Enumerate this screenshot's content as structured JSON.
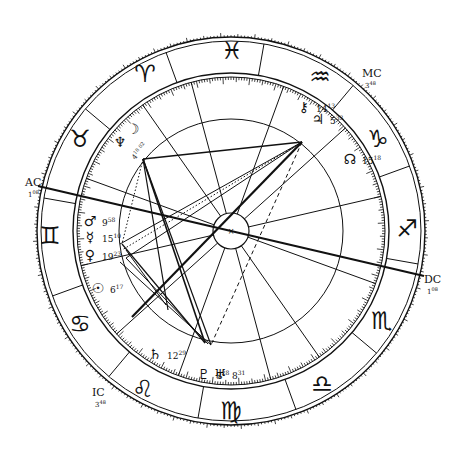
{
  "chart": {
    "center": [
      231,
      231
    ],
    "radii": {
      "outer": 194,
      "outer_inner": 190,
      "zodiac_inner": 158,
      "zodiac_inner2": 154,
      "house_circle": 112,
      "core": 18
    },
    "asc_angle_deg": 193,
    "colors": {
      "ink": "#111111",
      "background": "#ffffff"
    }
  },
  "zodiac_signs": [
    {
      "name": "aries",
      "glyph": "♈",
      "x": 145,
      "y": 75
    },
    {
      "name": "taurus",
      "glyph": "♉",
      "x": 80,
      "y": 140
    },
    {
      "name": "gemini",
      "glyph": "♊",
      "x": 50,
      "y": 237
    },
    {
      "name": "cancer",
      "glyph": "♋",
      "x": 80,
      "y": 325
    },
    {
      "name": "leo",
      "glyph": "♌",
      "x": 143,
      "y": 390
    },
    {
      "name": "virgo",
      "glyph": "♍",
      "x": 231,
      "y": 412
    },
    {
      "name": "libra",
      "glyph": "♎",
      "x": 322,
      "y": 385
    },
    {
      "name": "scorpio",
      "glyph": "♏",
      "x": 382,
      "y": 322
    },
    {
      "name": "sagittarius",
      "glyph": "♐",
      "x": 407,
      "y": 230
    },
    {
      "name": "capricorn",
      "glyph": "♑",
      "x": 378,
      "y": 140
    },
    {
      "name": "aquarius",
      "glyph": "♒",
      "x": 320,
      "y": 78
    },
    {
      "name": "pisces",
      "glyph": "♓",
      "x": 232,
      "y": 52
    }
  ],
  "angles": [
    {
      "name": "AC",
      "label": "AC",
      "degree": "1",
      "minutes": "08",
      "x": 25,
      "y": 186
    },
    {
      "name": "DC",
      "label": "DC",
      "degree": "1",
      "minutes": "08",
      "x": 424,
      "y": 283
    },
    {
      "name": "MC",
      "label": "MC",
      "degree": "3",
      "minutes": "48",
      "x": 362,
      "y": 77
    },
    {
      "name": "IC",
      "label": "IC",
      "degree": "3",
      "minutes": "48",
      "x": 92,
      "y": 396
    }
  ],
  "planets": [
    {
      "name": "moon",
      "glyph": "☽",
      "x": 133,
      "y": 130
    },
    {
      "name": "neptune",
      "glyph": "♆",
      "x": 120,
      "y": 143
    },
    {
      "name": "moon-neptune-degree",
      "text": "4",
      "sup": "18 02",
      "x": 135,
      "y": 160
    },
    {
      "name": "mars",
      "glyph": "♂",
      "x": 90,
      "y": 222,
      "degree": "9",
      "minutes": "58"
    },
    {
      "name": "mercury",
      "glyph": "☿",
      "x": 90,
      "y": 238,
      "degree": "15",
      "minutes": "10"
    },
    {
      "name": "venus",
      "glyph": "♀",
      "x": 90,
      "y": 256,
      "degree": "19",
      "minutes": "23"
    },
    {
      "name": "sun",
      "glyph": "☉",
      "x": 98,
      "y": 289,
      "degree": "6",
      "minutes": "17"
    },
    {
      "name": "saturn",
      "glyph": "♄",
      "x": 155,
      "y": 355,
      "degree": "12",
      "minutes": "29"
    },
    {
      "name": "pluto",
      "glyph": "♇",
      "x": 204,
      "y": 375,
      "degree": "8",
      "minutes": "28"
    },
    {
      "name": "uranus",
      "glyph": "♅",
      "x": 220,
      "y": 375,
      "degree": "8",
      "minutes": "31"
    },
    {
      "name": "chiron",
      "glyph": "⚷",
      "x": 304,
      "y": 108,
      "degree": "14",
      "minutes": "13"
    },
    {
      "name": "jupiter",
      "glyph": "♃",
      "x": 318,
      "y": 120,
      "degree": "5",
      "minutes": "33"
    },
    {
      "name": "north-node",
      "glyph": "☊",
      "x": 350,
      "y": 160,
      "degree": "15",
      "minutes": "18"
    }
  ],
  "house_cusp_angles_deg": [
    193,
    222,
    250,
    285,
    305,
    340,
    13,
    42,
    70,
    105,
    125,
    160
  ],
  "aspect_lines": [
    {
      "from": [
        143,
        159
      ],
      "to": [
        302,
        142
      ],
      "style": "solid",
      "weight": 1.6
    },
    {
      "from": [
        143,
        159
      ],
      "to": [
        205,
        343
      ],
      "style": "solid",
      "weight": 1.6
    },
    {
      "from": [
        143,
        159
      ],
      "to": [
        211,
        345
      ],
      "style": "solid",
      "weight": 1.2
    },
    {
      "from": [
        143,
        159
      ],
      "to": [
        168,
        310
      ],
      "style": "solid",
      "weight": 1.2
    },
    {
      "from": [
        143,
        159
      ],
      "to": [
        122,
        244
      ],
      "style": "dotted",
      "weight": 1.0
    },
    {
      "from": [
        302,
        142
      ],
      "to": [
        120,
        244
      ],
      "style": "solid",
      "weight": 1.0
    },
    {
      "from": [
        302,
        142
      ],
      "to": [
        122,
        250
      ],
      "style": "dotted",
      "weight": 1.0
    },
    {
      "from": [
        302,
        142
      ],
      "to": [
        126,
        258
      ],
      "style": "solid",
      "weight": 1.0
    },
    {
      "from": [
        302,
        142
      ],
      "to": [
        132,
        317
      ],
      "style": "solid",
      "weight": 2.2
    },
    {
      "from": [
        302,
        142
      ],
      "to": [
        211,
        345
      ],
      "style": "dashed",
      "weight": 1.0
    },
    {
      "from": [
        122,
        244
      ],
      "to": [
        205,
        343
      ],
      "style": "solid",
      "weight": 1.2
    },
    {
      "from": [
        126,
        258
      ],
      "to": [
        208,
        344
      ],
      "style": "solid",
      "weight": 1.0
    },
    {
      "from": [
        120,
        262
      ],
      "to": [
        211,
        345
      ],
      "style": "solid",
      "weight": 1.0
    },
    {
      "from": [
        38,
        186
      ],
      "to": [
        424,
        276
      ],
      "style": "solid",
      "weight": 2.0
    },
    {
      "from": [
        126,
        250
      ],
      "to": [
        166,
        305
      ],
      "style": "solid",
      "weight": 1.0
    }
  ]
}
